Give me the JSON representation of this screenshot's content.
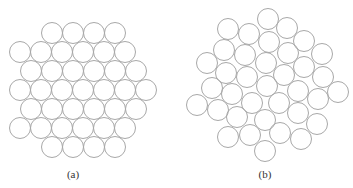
{
  "figure": {
    "circle_radius": 10.5,
    "stroke_color": "#a8a8a8",
    "panels": [
      {
        "label": "(a)",
        "label_pos": [
          73,
          168
        ],
        "description": "hexagonal close packing",
        "rows": [
          {
            "y": 33,
            "x": [
              52,
              73,
              94,
              115
            ]
          },
          {
            "y": 52,
            "x": [
              20,
              41,
              62,
              83,
              104,
              125
            ]
          },
          {
            "y": 71,
            "x": [
              31,
              52,
              73,
              94,
              115,
              136
            ]
          },
          {
            "y": 90,
            "x": [
              20,
              41,
              62,
              83,
              104,
              125,
              146
            ]
          },
          {
            "y": 109,
            "x": [
              31,
              52,
              73,
              94,
              115,
              136
            ]
          },
          {
            "y": 128,
            "x": [
              20,
              41,
              62,
              83,
              104,
              125
            ]
          },
          {
            "y": 147,
            "x": [
              52,
              73,
              94,
              115
            ]
          }
        ]
      },
      {
        "label": "(b)",
        "label_pos": [
          265,
          168
        ],
        "description": "random packing",
        "circles": [
          [
            268,
            19
          ],
          [
            228,
            29
          ],
          [
            249,
            34
          ],
          [
            287,
            28
          ],
          [
            269,
            42
          ],
          [
            304,
            41
          ],
          [
            224,
            50
          ],
          [
            245,
            55
          ],
          [
            288,
            53
          ],
          [
            322,
            54
          ],
          [
            207,
            63
          ],
          [
            266,
            63
          ],
          [
            304,
            67
          ],
          [
            226,
            73
          ],
          [
            247,
            77
          ],
          [
            284,
            75
          ],
          [
            323,
            77
          ],
          [
            212,
            88
          ],
          [
            267,
            86
          ],
          [
            232,
            94
          ],
          [
            298,
            91
          ],
          [
            338,
            92
          ],
          [
            318,
            99
          ],
          [
            197,
            105
          ],
          [
            252,
            103
          ],
          [
            279,
            103
          ],
          [
            218,
            110
          ],
          [
            298,
            113
          ],
          [
            237,
            117
          ],
          [
            265,
            120
          ],
          [
            317,
            124
          ],
          [
            228,
            137
          ],
          [
            250,
            135
          ],
          [
            280,
            133
          ],
          [
            301,
            139
          ],
          [
            265,
            151
          ]
        ]
      }
    ]
  }
}
